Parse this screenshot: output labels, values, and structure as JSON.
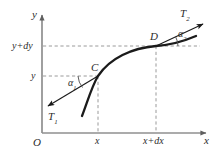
{
  "figure": {
    "type": "geometric-diagram",
    "background_color": "#ffffff",
    "curve_color": "#1a1a1a",
    "axis_color": "#8a8a8a",
    "dashed_color": "#8a8a8a",
    "text_color": "#2b2b2b"
  },
  "axes": {
    "y_axis_label": "y",
    "x_axis_label": "x",
    "origin_label": "O"
  },
  "ticks": {
    "y": [
      {
        "label_main": "y+d",
        "label_italic_tail": "y",
        "text": "y+dy",
        "value_y_px": 46
      },
      {
        "label_main": "",
        "label_italic_tail": "y",
        "text": "y",
        "value_y_px": 76
      }
    ],
    "x": [
      {
        "text": "x",
        "value_x_px": 98
      },
      {
        "text": "x+dx",
        "prefix": "x+",
        "roman": "d",
        "suffix": "x",
        "value_x_px": 156
      }
    ]
  },
  "points": [
    {
      "name": "C",
      "label": "C",
      "x_px": 98,
      "y_px": 76
    },
    {
      "name": "D",
      "label": "D",
      "x_px": 156,
      "y_px": 46
    }
  ],
  "forces": [
    {
      "name": "T1",
      "base": "T",
      "sub": "1",
      "direction": "down-left",
      "anchor_point": "C"
    },
    {
      "name": "T2",
      "base": "T",
      "sub": "2",
      "direction": "up-right",
      "anchor_point": "D"
    }
  ],
  "angles": [
    {
      "name": "alpha1",
      "base": "α",
      "sub": "1",
      "at_point": "C"
    },
    {
      "name": "alpha2",
      "base": "α",
      "sub": "2",
      "at_point": "D"
    }
  ]
}
